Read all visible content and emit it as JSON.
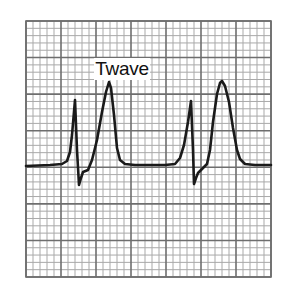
{
  "figure": {
    "type": "ecg-strip",
    "annotation": "Twave",
    "colors": {
      "background": "#ffffff",
      "grid_minor": "#a9a9a9",
      "grid_major": "#6e6e6e",
      "trace": "#1a1a1a"
    },
    "grid": {
      "left": 26,
      "top": 21,
      "right": 271,
      "bottom": 277,
      "major_cols": 7,
      "major_rows": 7,
      "minor_per_major": 5
    },
    "trace_points": [
      [
        26,
        166
      ],
      [
        50,
        165
      ],
      [
        62,
        164
      ],
      [
        67,
        161
      ],
      [
        70,
        152
      ],
      [
        72,
        135
      ],
      [
        75,
        100
      ],
      [
        77,
        150
      ],
      [
        79,
        185
      ],
      [
        81,
        178
      ],
      [
        83,
        172
      ],
      [
        88,
        170
      ],
      [
        92,
        160
      ],
      [
        97,
        140
      ],
      [
        102,
        112
      ],
      [
        106,
        92
      ],
      [
        109,
        82
      ],
      [
        111,
        88
      ],
      [
        114,
        115
      ],
      [
        117,
        148
      ],
      [
        120,
        160
      ],
      [
        125,
        164
      ],
      [
        135,
        165
      ],
      [
        165,
        165
      ],
      [
        175,
        164
      ],
      [
        180,
        158
      ],
      [
        184,
        145
      ],
      [
        188,
        122
      ],
      [
        191,
        101
      ],
      [
        193,
        150
      ],
      [
        194,
        184
      ],
      [
        196,
        178
      ],
      [
        198,
        173
      ],
      [
        203,
        168
      ],
      [
        207,
        164
      ],
      [
        210,
        150
      ],
      [
        213,
        122
      ],
      [
        217,
        94
      ],
      [
        220,
        83
      ],
      [
        222,
        81
      ],
      [
        225,
        86
      ],
      [
        229,
        102
      ],
      [
        233,
        128
      ],
      [
        237,
        150
      ],
      [
        240,
        159
      ],
      [
        245,
        164
      ],
      [
        255,
        165
      ],
      [
        271,
        165
      ]
    ]
  }
}
